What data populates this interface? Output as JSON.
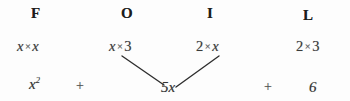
{
  "diagram": {
    "background_color": "#fdfdfd",
    "ink_color": "#2b2b2b",
    "headers": [
      {
        "key": "first",
        "label": "F"
      },
      {
        "key": "outer",
        "label": "O"
      },
      {
        "key": "inner",
        "label": "I"
      },
      {
        "key": "last",
        "label": "L"
      }
    ],
    "terms": [
      {
        "key": "first",
        "left": "x",
        "operator": "×",
        "right": "x"
      },
      {
        "key": "outer",
        "left": "x",
        "operator": "×",
        "right": "3"
      },
      {
        "key": "inner",
        "left": "2",
        "operator": "×",
        "right": "x"
      },
      {
        "key": "last",
        "left": "2",
        "operator": "×",
        "right": "3"
      }
    ],
    "results": {
      "first_term_coefficient": "x",
      "first_term_exponent": "2",
      "plus_one": "+",
      "combined_middle": "5x",
      "plus_two": "+",
      "constant": "6"
    }
  }
}
